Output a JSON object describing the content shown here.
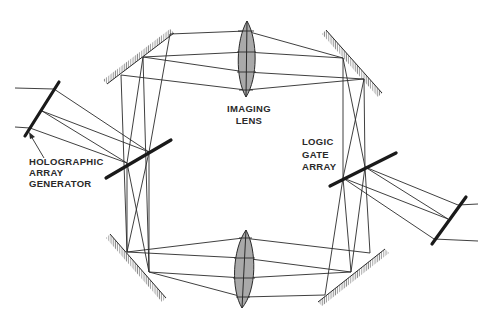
{
  "diagram": {
    "colors": {
      "line": "#2a2a2a",
      "lens_fill": "#a9a9a9",
      "mirror_hatch": "#8a8a8a",
      "background": "#ffffff"
    },
    "labels": {
      "imaging_lens": [
        "IMAGING",
        "LENS"
      ],
      "logic_gate_array": [
        "LOGIC",
        "GATE",
        "ARRAY"
      ],
      "holographic_array_generator": [
        "HOLOGRAPHIC",
        "ARRAY",
        "GENERATOR"
      ]
    },
    "components": [
      {
        "name": "top imaging lens",
        "type": "lens"
      },
      {
        "name": "bottom imaging lens",
        "type": "lens"
      },
      {
        "name": "top-left mirror",
        "type": "mirror"
      },
      {
        "name": "top-right mirror",
        "type": "mirror"
      },
      {
        "name": "bottom-left mirror",
        "type": "mirror"
      },
      {
        "name": "bottom-right mirror",
        "type": "mirror"
      },
      {
        "name": "holographic array generator beam splitter",
        "type": "beam-splitter"
      },
      {
        "name": "logic gate array",
        "type": "beam-splitter"
      },
      {
        "name": "input plate",
        "type": "plate"
      },
      {
        "name": "output plate",
        "type": "plate"
      }
    ]
  }
}
